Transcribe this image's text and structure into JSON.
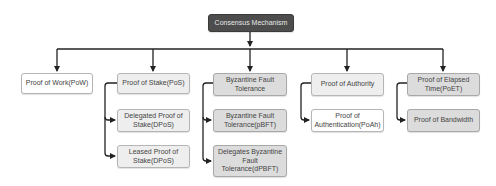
{
  "diagram": {
    "root": {
      "label": "Consensus Mechanism",
      "color": "#4d4d4d"
    },
    "branches": [
      {
        "label": "Proof of Work(PoW)",
        "children": []
      },
      {
        "label": "Proof of Stake(PoS)",
        "children": [
          {
            "label": "Delegated Proof of Stake(DPoS)"
          },
          {
            "label": "Leased Proof of Stake(DPoS)"
          }
        ]
      },
      {
        "label": "Byzantine Fault Tolerance",
        "children": [
          {
            "label": "Byzantine Fault Tolerance(pBFT)"
          },
          {
            "label": "Delegates Byzantine Fault Tolerance(dPBFT)"
          }
        ]
      },
      {
        "label": "Proof of Authority",
        "children": [
          {
            "label": "Proof of Authentication(PoAh)"
          }
        ]
      },
      {
        "label": "Proof of Elapsed Time(PoET)",
        "children": [
          {
            "label": "Proof of Bandwidth"
          }
        ]
      }
    ]
  }
}
